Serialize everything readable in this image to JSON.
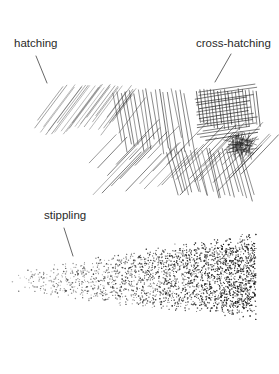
{
  "figure": {
    "background": "#ffffff",
    "ink_color": "#1e1e1e",
    "labels": [
      {
        "id": "hatching",
        "text": "hatching",
        "x": 14,
        "y": 38,
        "leader": {
          "x1": 36,
          "y1": 56,
          "x2": 47,
          "y2": 83
        }
      },
      {
        "id": "cross-hatching",
        "text": "cross-hatching",
        "x": 196,
        "y": 38,
        "leader": {
          "x1": 231,
          "y1": 54,
          "x2": 215,
          "y2": 82
        }
      },
      {
        "id": "stippling",
        "text": "stippling",
        "x": 44,
        "y": 210,
        "leader": {
          "x1": 64,
          "y1": 228,
          "x2": 73,
          "y2": 256
        }
      }
    ],
    "hatching_region": {
      "description": "parallel diagonal strokes",
      "x_range": [
        34,
        118
      ],
      "y_range": [
        84,
        150
      ],
      "stroke_opacity": 0.55
    },
    "cross_hatching_region": {
      "description": "layered crossing strokes, densest at right",
      "x_range": [
        90,
        262
      ],
      "y_range": [
        84,
        196
      ],
      "dark_spot": {
        "cx": 242,
        "cy": 145,
        "r": 12
      }
    },
    "stippling_region": {
      "description": "dot field, sparse at left, dense at right",
      "x_range": [
        12,
        256
      ],
      "y_range": [
        240,
        330
      ],
      "dense_center": {
        "cx": 235,
        "cy": 262
      }
    }
  }
}
